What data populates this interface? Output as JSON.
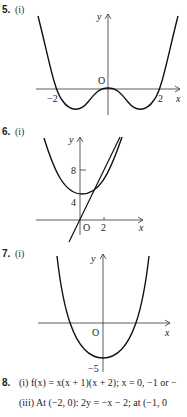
{
  "questions": [
    {
      "number": "5.",
      "part": "(i)",
      "graph": {
        "x_label": "x",
        "y_label": "y",
        "origin": "O",
        "x_ticks": [
          "−2",
          "2"
        ]
      }
    },
    {
      "number": "6.",
      "part": "(i)",
      "graph": {
        "x_label": "x",
        "y_label": "y",
        "origin": "O",
        "x_ticks": [
          "2"
        ],
        "y_ticks": [
          "8",
          "4"
        ]
      }
    },
    {
      "number": "7.",
      "part": "(i)",
      "graph": {
        "x_label": "x",
        "y_label": "y",
        "origin": "O",
        "y_ticks": [
          "−5"
        ]
      }
    },
    {
      "number": "8.",
      "lines": [
        "(i) f(x) = x(x + 1)(x + 2); x = 0, −1 or −",
        "(iii) At (−2, 0): 2y = −x − 2; at (−1, 0"
      ]
    }
  ]
}
